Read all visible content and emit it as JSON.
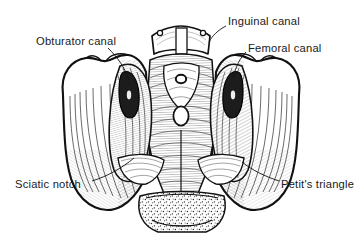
{
  "figure": {
    "style": "black-and-white pen-and-ink line engraving",
    "background_color": "#ffffff",
    "ink_color": "#1a1a1a",
    "width": 362,
    "height": 236
  },
  "labels": [
    {
      "id": "obturator",
      "text": "Obturator canal",
      "x": 36,
      "y": 36,
      "leader_to": "left obturator foramen aperture"
    },
    {
      "id": "inguinal",
      "text": "Inguinal canal",
      "x": 228,
      "y": 16,
      "leader_to": "right superior pubic region"
    },
    {
      "id": "femoral",
      "text": "Femoral canal",
      "x": 248,
      "y": 43,
      "leader_to": "right femoral ring aperture"
    },
    {
      "id": "sciatic",
      "text": "Sciatic notch",
      "x": 15,
      "y": 179,
      "leader_to": "left greater sciatic notch"
    },
    {
      "id": "petit",
      "text": "Petit's triangle",
      "x": 281,
      "y": 179,
      "leader_to": "right lumbar triangle"
    }
  ],
  "structures": [
    {
      "name": "left-iliac-wing",
      "description": "scalloped iliac crest, heavy outline, parallel hatching"
    },
    {
      "name": "right-iliac-wing",
      "description": "scalloped iliac crest, mirrored"
    },
    {
      "name": "pubic-symphysis",
      "description": "central superior block between pubic tubercles"
    },
    {
      "name": "obturator-canal-left",
      "description": "dark almond aperture, left side"
    },
    {
      "name": "femoral-canal-right",
      "description": "dark almond aperture, right side"
    },
    {
      "name": "central-ring",
      "description": "small ring aperture in midline shield"
    },
    {
      "name": "oval-foramen",
      "description": "oval opening below central ring"
    },
    {
      "name": "sacrotuberous-bands",
      "description": "paired transverse ligament bands, lower third"
    },
    {
      "name": "sacrum-coccyx",
      "description": "stippled cancellous bone at base"
    }
  ]
}
